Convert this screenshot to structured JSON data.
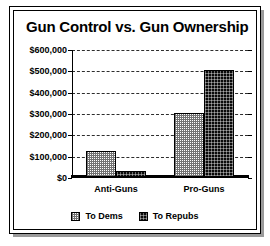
{
  "chart_data": {
    "type": "bar",
    "title": "Gun Control vs. Gun Ownership",
    "xlabel": "",
    "ylabel": "",
    "categories": [
      "Anti-Guns",
      "Pro-Guns"
    ],
    "series": [
      {
        "name": "To Dems",
        "values": [
          120000,
          300000
        ],
        "color": "#d9d9d9",
        "pattern": "light-checker"
      },
      {
        "name": "To Repubs",
        "values": [
          30000,
          500000
        ],
        "color": "#111111",
        "pattern": "dark-checker"
      }
    ],
    "ylim": [
      0,
      600000
    ],
    "yticks": [
      0,
      100000,
      200000,
      300000,
      400000,
      500000,
      600000
    ],
    "ytick_labels": [
      "$0",
      "$100,000",
      "$200,000",
      "$300,000",
      "$400,000",
      "$500,000",
      "$600,000"
    ],
    "grid": true,
    "grid_style": "dotted-horizontal",
    "legend_position": "bottom-center"
  }
}
